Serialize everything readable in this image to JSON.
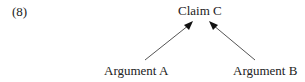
{
  "diagram": {
    "example_number": "(8)",
    "claim": {
      "label": "Claim C"
    },
    "arguments": [
      {
        "label": "Argument A"
      },
      {
        "label": "Argument B"
      }
    ],
    "edges": [
      {
        "from": "Argument A",
        "to": "Claim C"
      },
      {
        "from": "Argument B",
        "to": "Claim C"
      }
    ],
    "colors": {
      "text": "#222222",
      "arrow": "#555555",
      "arrowhead": "#111111"
    }
  }
}
